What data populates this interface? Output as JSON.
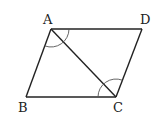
{
  "diagram": {
    "type": "parallelogram-with-diagonal",
    "labels": {
      "A": "A",
      "B": "B",
      "C": "C",
      "D": "D"
    },
    "vertices": {
      "A": [
        51,
        29
      ],
      "D": [
        142,
        29
      ],
      "B": [
        26,
        97
      ],
      "C": [
        116,
        97
      ]
    },
    "segments": [
      "AB",
      "BC",
      "CD",
      "DA",
      "AC"
    ],
    "angle_marks": [
      "BAD",
      "BCD"
    ],
    "colors": {
      "stroke": "#222222",
      "arc": "#555555",
      "background": "#ffffff"
    }
  }
}
